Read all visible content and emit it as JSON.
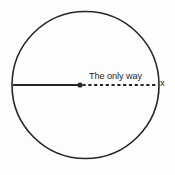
{
  "figure": {
    "title": "",
    "background_color": "#fdfdfd",
    "stroke_color": "#262626",
    "text_color": "#262626"
  },
  "labels": {
    "annotation": "The only way",
    "axis_x": "x"
  },
  "chart_data": {
    "type": "diagram",
    "subtype": "circle-with-diameter",
    "title": "",
    "xlabel": "x",
    "ylabel": "",
    "elements": [
      {
        "name": "circle",
        "shape": "circle",
        "center_x": 85.5,
        "center_y": 85,
        "radius": 73.5,
        "stroke": "#262626",
        "stroke_width": 1.6,
        "fill": "none"
      },
      {
        "name": "solid-radius",
        "shape": "line",
        "style": "solid",
        "x1": 13,
        "y1": 85,
        "x2": 80,
        "y2": 85,
        "stroke": "#262626",
        "stroke_width": 1.9
      },
      {
        "name": "dashed-radius",
        "shape": "line",
        "style": "dashed",
        "x1": 82,
        "y1": 85,
        "x2": 158,
        "y2": 85,
        "stroke": "#262626",
        "stroke_width": 1.9,
        "dash_pattern": "3.2 2.6"
      },
      {
        "name": "center-point",
        "shape": "dot",
        "cx": 80,
        "cy": 85,
        "r": 2.6,
        "fill": "#262626"
      }
    ],
    "annotations": [
      {
        "text": "The only way",
        "x": 89,
        "y": 78,
        "anchor": "start",
        "font_size": 9.2
      },
      {
        "text": "x",
        "x": 160,
        "y": 86,
        "anchor": "start",
        "font_size": 9.5
      }
    ]
  }
}
